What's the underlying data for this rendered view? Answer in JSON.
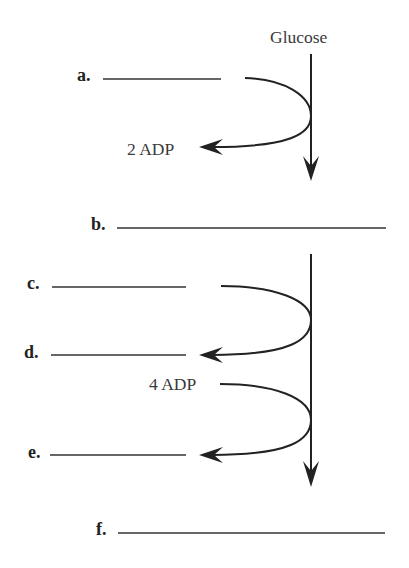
{
  "diagram": {
    "title_molecule": "Glucose",
    "colors": {
      "ink": "#222222",
      "text": "#3a3a3a",
      "background": "#ffffff"
    },
    "blanks": [
      {
        "id": "a",
        "label": "a.",
        "value": ""
      },
      {
        "id": "b",
        "label": "b.",
        "value": ""
      },
      {
        "id": "c",
        "label": "c.",
        "value": ""
      },
      {
        "id": "d",
        "label": "d.",
        "value": ""
      },
      {
        "id": "e",
        "label": "e.",
        "value": ""
      },
      {
        "id": "f",
        "label": "f.",
        "value": ""
      }
    ],
    "reactions": [
      {
        "input": "a",
        "output": "2 ADP"
      },
      {
        "input": "c",
        "output": "d"
      },
      {
        "input": "4 ADP",
        "output": "e"
      }
    ],
    "molecules": {
      "adp_2": "2 ADP",
      "adp_4": "4 ADP"
    }
  }
}
